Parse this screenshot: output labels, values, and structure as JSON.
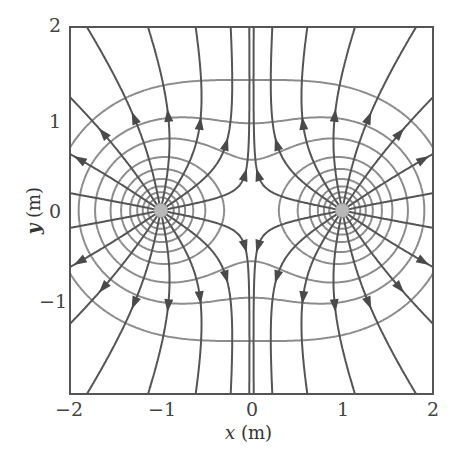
{
  "chart_data": {
    "type": "vector-field",
    "title": "",
    "xlabel": "x (m)",
    "ylabel": "y (m)",
    "xlim": [
      -2,
      2
    ],
    "ylim": [
      -2,
      2
    ],
    "xticks": [
      "−2",
      "−1",
      "0",
      "1",
      "2"
    ],
    "yticks": [
      "2",
      "1",
      "0",
      "−1"
    ],
    "charges": [
      {
        "x": -1,
        "y": 0,
        "sign": "+"
      },
      {
        "x": 1,
        "y": 0,
        "sign": "+"
      }
    ],
    "field_lines_per_charge": 16,
    "equipotential_count": 9,
    "colors": {
      "field_line": "#555555",
      "equipotential": "#8c8c8c",
      "frame": "#555555",
      "charge": "#b8b8b8"
    }
  },
  "axes": {
    "xlabel_italic": "x",
    "xlabel_unit": " (m)",
    "ylabel_italic": "y",
    "ylabel_unit": " (m)"
  }
}
